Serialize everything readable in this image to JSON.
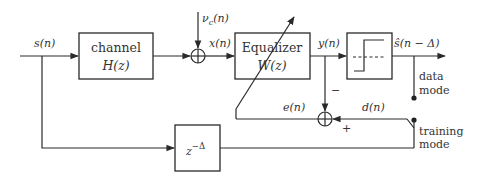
{
  "diagram": {
    "type": "block-diagram",
    "signals": {
      "input": "s(n)",
      "noise": "ν",
      "noise_sub": "c",
      "noise_arg": "(n)",
      "equalizer_input": "x(n)",
      "equalizer_output": "y(n)",
      "decision_output": "ŝ(n − Δ)",
      "error": "e(n)",
      "desired": "d(n)"
    },
    "blocks": {
      "channel": {
        "line1": "channel",
        "line2": "H(z)"
      },
      "equalizer": {
        "line1": "Equalizer",
        "line2": "W(z)"
      },
      "decision": {
        "description": "slicer / decision device"
      },
      "delay": {
        "base": "z",
        "exponent": "−Δ"
      }
    },
    "signs": {
      "minus": "−",
      "plus": "+"
    },
    "modes": {
      "data": {
        "line1": "data",
        "line2": "mode"
      },
      "training": {
        "line1": "training",
        "line2": "mode"
      }
    },
    "colors": {
      "stroke": "#2a2a2a",
      "text": "#333333",
      "background": "#ffffff"
    }
  }
}
